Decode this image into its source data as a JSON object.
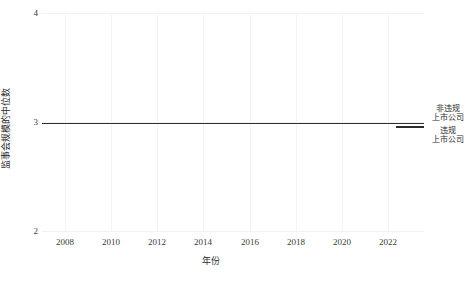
{
  "chart_data": {
    "type": "line",
    "title": "",
    "xlabel": "年份",
    "ylabel": "监事会规模的中位数",
    "x": [
      2007,
      2008,
      2009,
      2010,
      2011,
      2012,
      2013,
      2014,
      2015,
      2016,
      2017,
      2018,
      2019,
      2020,
      2021,
      2022,
      2023
    ],
    "xticks": [
      "2008",
      "2010",
      "2012",
      "2014",
      "2016",
      "2018",
      "2020",
      "2022"
    ],
    "xtick_values": [
      2008,
      2010,
      2012,
      2014,
      2016,
      2018,
      2020,
      2022
    ],
    "xlim": [
      2006.5,
      2023.5
    ],
    "yticks": [
      "2",
      "3",
      "4"
    ],
    "ytick_values": [
      2,
      3,
      4
    ],
    "ylim": [
      2,
      4
    ],
    "grid": true,
    "legend_position": "right",
    "series": [
      {
        "name": "非违规上市公司",
        "legend_line1": "非违规",
        "legend_line2": "上市公司",
        "color": "#4a4a4a",
        "values": [
          3,
          3,
          3,
          3,
          3,
          3,
          3,
          3,
          3,
          3,
          3,
          3,
          3,
          3,
          3,
          3,
          3
        ]
      },
      {
        "name": "违规上市公司",
        "legend_line1": "违规",
        "legend_line2": "上市公司",
        "color": "#2e2e2e",
        "values": [
          3,
          3,
          3,
          3,
          3,
          3,
          3,
          3,
          3,
          3,
          3,
          3,
          3,
          3,
          3,
          3,
          3
        ]
      }
    ]
  }
}
